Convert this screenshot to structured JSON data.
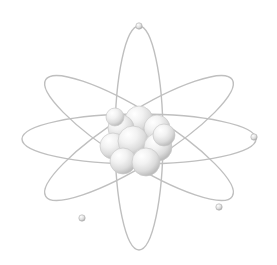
{
  "figure": {
    "background_color": "#ffffff",
    "width": 277,
    "height": 265,
    "center": {
      "x": 139,
      "y": 138
    }
  },
  "nucleus": {
    "name": "nucleus",
    "label": "nucleus",
    "cluster_center": {
      "x": 139,
      "y": 138
    },
    "cluster_radius": 36,
    "sphere_fill_light": "#ffffff",
    "sphere_fill_mid": "#e9e9e9",
    "sphere_fill_dark": "#b9b9b9",
    "sphere_edge_color": "#c9c9c9",
    "particle_count": 10,
    "particles": [
      {
        "id": "nucleon-1",
        "cx": 139,
        "cy": 120,
        "r": 14
      },
      {
        "id": "nucleon-2",
        "cx": 121,
        "cy": 128,
        "r": 13
      },
      {
        "id": "nucleon-3",
        "cx": 157,
        "cy": 128,
        "r": 13
      },
      {
        "id": "nucleon-4",
        "cx": 113,
        "cy": 146,
        "r": 13
      },
      {
        "id": "nucleon-5",
        "cx": 133,
        "cy": 141,
        "r": 15
      },
      {
        "id": "nucleon-6",
        "cx": 158,
        "cy": 147,
        "r": 14
      },
      {
        "id": "nucleon-7",
        "cx": 123,
        "cy": 161,
        "r": 13
      },
      {
        "id": "nucleon-8",
        "cx": 146,
        "cy": 162,
        "r": 14
      },
      {
        "id": "nucleon-9",
        "cx": 164,
        "cy": 135,
        "r": 11
      },
      {
        "id": "nucleon-10",
        "cx": 115,
        "cy": 117,
        "r": 9
      }
    ]
  },
  "orbits": {
    "stroke_color": "#bfbfbf",
    "stroke_width": 1.4,
    "paths": [
      {
        "id": "orbit-vertical",
        "label": "vertical orbit",
        "cx": 139,
        "cy": 138,
        "rx": 24,
        "ry": 112,
        "rotation": 0
      },
      {
        "id": "orbit-horizontal",
        "label": "horizontal orbit",
        "cx": 139,
        "cy": 139,
        "rx": 117,
        "ry": 25,
        "rotation": 0
      },
      {
        "id": "orbit-diagonal-right",
        "label": "diagonal orbit tilted right",
        "cx": 139,
        "cy": 138,
        "rx": 26,
        "ry": 110,
        "rotation": 58
      },
      {
        "id": "orbit-diagonal-left",
        "label": "diagonal orbit tilted left",
        "cx": 139,
        "cy": 138,
        "rx": 26,
        "ry": 110,
        "rotation": -58
      }
    ]
  },
  "electrons": {
    "fill_color": "#d6d6d6",
    "edge_color": "#b0b0b0",
    "radius": 3.2,
    "items": [
      {
        "id": "electron-top",
        "label": "electron on vertical orbit (top)",
        "cx": 139,
        "cy": 26
      },
      {
        "id": "electron-right",
        "label": "electron on horizontal orbit (right)",
        "cx": 254,
        "cy": 137
      },
      {
        "id": "electron-bottom-right",
        "label": "electron on diagonal orbit (lower right)",
        "cx": 219,
        "cy": 207
      },
      {
        "id": "electron-bottom-left",
        "label": "electron on diagonal orbit (lower left)",
        "cx": 82,
        "cy": 218
      }
    ]
  },
  "colors": {
    "background": "#ffffff",
    "orbit_line": "#bfbfbf",
    "nucleus_highlight": "#ffffff",
    "nucleus_shadow": "#b0b0b0"
  }
}
